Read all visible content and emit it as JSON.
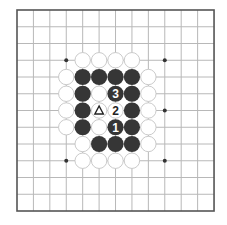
{
  "board": {
    "title": "Go diagram",
    "lines": 13,
    "origin": {
      "x": 17,
      "y": 10
    },
    "spacing": {
      "x": 16.42,
      "y": 16.75
    },
    "frame_color": "#555555",
    "grid_color": "#b8b8b8",
    "background": "#ffffff",
    "black_color": "#363636",
    "white_fill": "#ffffff",
    "white_stroke": "#c4c4c4",
    "star_points": [
      {
        "col": 3,
        "row": 3
      },
      {
        "col": 9,
        "row": 3
      },
      {
        "col": 9,
        "row": 6
      },
      {
        "col": 3,
        "row": 9
      },
      {
        "col": 9,
        "row": 9
      }
    ]
  },
  "stones": [
    {
      "color": "white",
      "col": 4,
      "row": 3
    },
    {
      "color": "white",
      "col": 5,
      "row": 3
    },
    {
      "color": "white",
      "col": 6,
      "row": 3
    },
    {
      "color": "white",
      "col": 7,
      "row": 3
    },
    {
      "color": "white",
      "col": 3,
      "row": 4
    },
    {
      "color": "black",
      "col": 4,
      "row": 4
    },
    {
      "color": "black",
      "col": 5,
      "row": 4
    },
    {
      "color": "black",
      "col": 6,
      "row": 4
    },
    {
      "color": "black",
      "col": 7,
      "row": 4
    },
    {
      "color": "white",
      "col": 8,
      "row": 4
    },
    {
      "color": "white",
      "col": 3,
      "row": 5
    },
    {
      "color": "black",
      "col": 4,
      "row": 5
    },
    {
      "color": "white",
      "col": 5,
      "row": 5
    },
    {
      "color": "black",
      "col": 6,
      "row": 5,
      "label": "3"
    },
    {
      "color": "black",
      "col": 7,
      "row": 5
    },
    {
      "color": "white",
      "col": 8,
      "row": 5
    },
    {
      "color": "white",
      "col": 3,
      "row": 6
    },
    {
      "color": "black",
      "col": 4,
      "row": 6
    },
    {
      "color": "white",
      "col": 5,
      "row": 6,
      "mark": "triangle"
    },
    {
      "color": "white",
      "col": 6,
      "row": 6,
      "label": "2"
    },
    {
      "color": "black",
      "col": 7,
      "row": 6
    },
    {
      "color": "white",
      "col": 8,
      "row": 6
    },
    {
      "color": "white",
      "col": 3,
      "row": 7
    },
    {
      "color": "black",
      "col": 4,
      "row": 7
    },
    {
      "color": "white",
      "col": 5,
      "row": 7
    },
    {
      "color": "black",
      "col": 6,
      "row": 7,
      "label": "1"
    },
    {
      "color": "black",
      "col": 7,
      "row": 7
    },
    {
      "color": "white",
      "col": 8,
      "row": 7
    },
    {
      "color": "white",
      "col": 4,
      "row": 8
    },
    {
      "color": "black",
      "col": 5,
      "row": 8
    },
    {
      "color": "black",
      "col": 6,
      "row": 8
    },
    {
      "color": "black",
      "col": 7,
      "row": 8
    },
    {
      "color": "white",
      "col": 8,
      "row": 8
    },
    {
      "color": "white",
      "col": 4,
      "row": 9
    },
    {
      "color": "white",
      "col": 5,
      "row": 9
    },
    {
      "color": "white",
      "col": 6,
      "row": 9
    },
    {
      "color": "white",
      "col": 7,
      "row": 9
    }
  ],
  "move_labels": [
    {
      "number": "1",
      "color": "black",
      "col": 6,
      "row": 7
    },
    {
      "number": "2",
      "color": "white",
      "col": 6,
      "row": 6
    },
    {
      "number": "3",
      "color": "black",
      "col": 6,
      "row": 5
    }
  ],
  "marks": [
    {
      "type": "triangle",
      "symbol": "△",
      "col": 5,
      "row": 6,
      "on": "white"
    }
  ]
}
